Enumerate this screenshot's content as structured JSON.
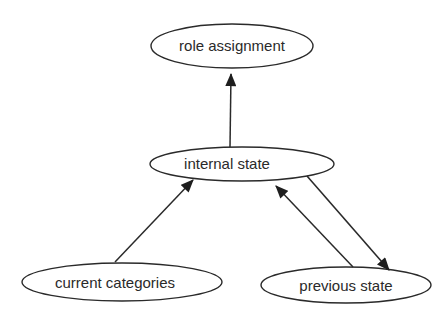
{
  "diagram": {
    "type": "flow",
    "colors": {
      "stroke": "#2a2a2a",
      "background": "#ffffff",
      "text": "#2a2a2a"
    },
    "nodes": [
      {
        "id": "role",
        "label": "role assignment"
      },
      {
        "id": "internal",
        "label": "internal state"
      },
      {
        "id": "current",
        "label": "current categories"
      },
      {
        "id": "previous",
        "label": "previous state"
      }
    ],
    "edges": [
      {
        "from": "internal",
        "to": "role"
      },
      {
        "from": "current",
        "to": "internal"
      },
      {
        "from": "internal",
        "to": "previous"
      },
      {
        "from": "previous",
        "to": "internal"
      }
    ]
  }
}
